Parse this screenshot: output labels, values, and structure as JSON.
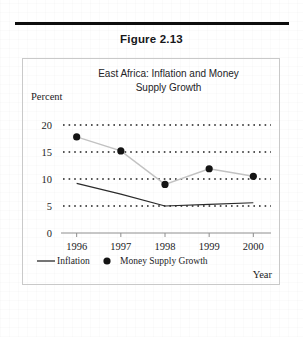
{
  "document": {
    "figure_number": "Figure 2.13"
  },
  "chart_data": {
    "type": "line",
    "title": "East Africa: Inflation and Money Supply Growth",
    "title_line1": "East Africa: Inflation and Money",
    "title_line2": "Supply Growth",
    "xlabel": "Year",
    "ylabel": "Percent",
    "categories": [
      "1996",
      "1997",
      "1998",
      "1999",
      "2000"
    ],
    "x": [
      1996,
      1997,
      1998,
      1999,
      2000
    ],
    "ylim": [
      0,
      20
    ],
    "xlim": [
      1995.6,
      2000.4
    ],
    "yticks": [
      "0",
      "5",
      "10",
      "15",
      "20"
    ],
    "ytick_values": [
      0,
      5,
      10,
      15,
      20
    ],
    "grid": "horizontal-dotted",
    "legend_position": "below-axis",
    "series": [
      {
        "name": "Inflation",
        "style": "line",
        "color": "#2b2b2b",
        "values": [
          9.2,
          7.2,
          5.0,
          5.3,
          5.6
        ]
      },
      {
        "name": "Money Supply Growth",
        "style": "marker-with-faint-line",
        "color": "#141414",
        "values": [
          17.8,
          15.2,
          9.0,
          11.9,
          10.5
        ]
      }
    ],
    "legend": [
      {
        "label": "Inflation",
        "marker": "line"
      },
      {
        "label": "Money Supply Growth",
        "marker": "dot"
      }
    ]
  }
}
